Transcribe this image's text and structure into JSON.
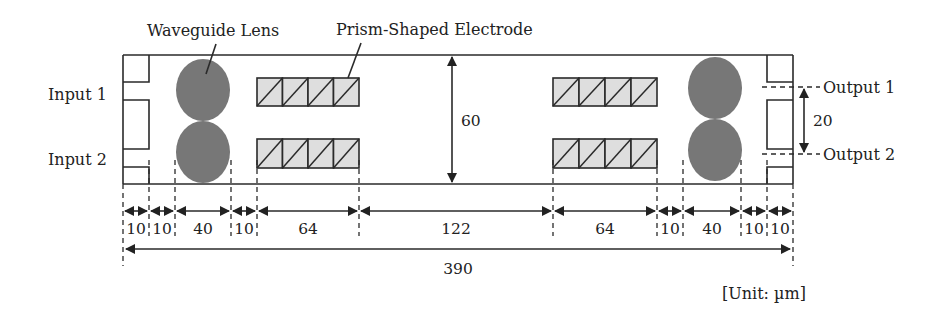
{
  "labels": {
    "waveguide_lens": "Waveguide Lens",
    "prism_electrode": "Prism-Shaped Electrode",
    "input1": "Input 1",
    "input2": "Input 2",
    "output1": "Output 1",
    "output2": "Output 2",
    "height_dim": "60",
    "output_sep_dim": "20",
    "unit": "[Unit: µm]"
  },
  "dimensions": {
    "segments": [
      "10",
      "10",
      "40",
      "10",
      "64",
      "122",
      "64",
      "10",
      "40",
      "10",
      "10"
    ],
    "total": "390"
  },
  "colors": {
    "lens_fill": "#777777",
    "electrode_fill": "#dedede",
    "line": "#2a2a2a"
  }
}
